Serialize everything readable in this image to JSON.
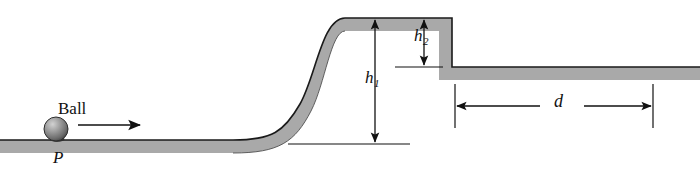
{
  "figure": {
    "kind": "physics-track-diagram",
    "labels": {
      "ball": "Ball",
      "point_p": "P",
      "height_1_base": "h",
      "height_1_sub": "1",
      "height_2_base": "h",
      "height_2_sub": "2",
      "distance": "d"
    },
    "colors": {
      "track_fill": "#a9a9a9",
      "track_edge": "#1a1a1a",
      "ball_dark": "#4a4a4a",
      "ball_light": "#cfcfcf",
      "background": "#ffffff",
      "annotation": "#111111"
    },
    "geometry": {
      "lower_left_track_top_y": 140,
      "plateau_top_y": 18,
      "lower_right_track_top_y": 67,
      "track_thickness": 13,
      "ramp_start_x": 233,
      "ramp_end_x": 345,
      "step_x": 452,
      "d_start_x": 455,
      "d_end_x": 653,
      "ball_center_x": 56,
      "ball_center_y": 130,
      "ball_radius": 12
    },
    "annotations": {
      "velocity_arrow_direction": "right",
      "h1_arrow": "double-headed-vertical",
      "h2_arrow": "double-headed-vertical",
      "d_arrow": "double-headed-horizontal"
    }
  }
}
